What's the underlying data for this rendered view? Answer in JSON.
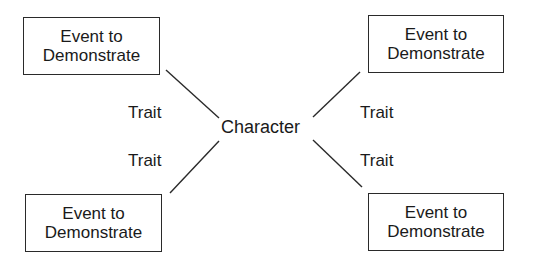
{
  "diagram": {
    "center": {
      "label": "Character"
    },
    "events": [
      {
        "position": "top-left",
        "line1": "Event to",
        "line2": "Demonstrate"
      },
      {
        "position": "top-right",
        "line1": "Event to",
        "line2": "Demonstrate"
      },
      {
        "position": "bottom-left",
        "line1": "Event to",
        "line2": "Demonstrate"
      },
      {
        "position": "bottom-right",
        "line1": "Event to",
        "line2": "Demonstrate"
      }
    ],
    "traits": [
      {
        "position": "top-left",
        "label": "Trait"
      },
      {
        "position": "top-right",
        "label": "Trait"
      },
      {
        "position": "bottom-left",
        "label": "Trait"
      },
      {
        "position": "bottom-right",
        "label": "Trait"
      }
    ],
    "colors": {
      "stroke": "#2a2a2a",
      "text": "#1a1a1a",
      "background": "#ffffff"
    }
  }
}
